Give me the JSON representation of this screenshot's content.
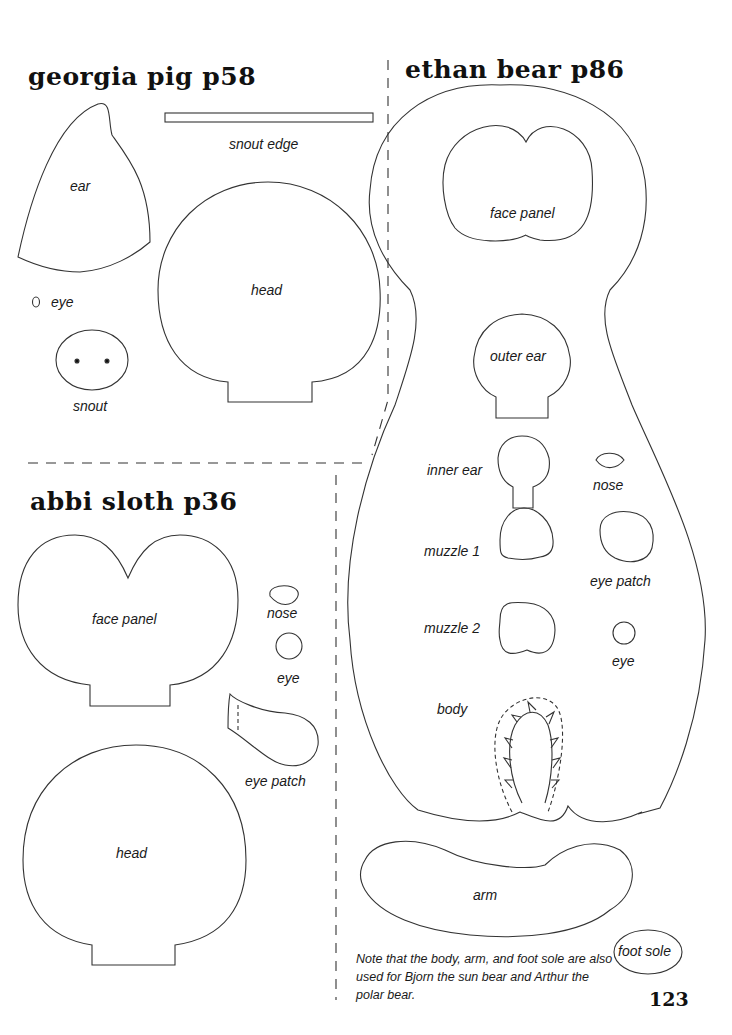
{
  "sections": {
    "georgia_pig": {
      "title": "georgia pig p58",
      "labels": {
        "ear": "ear",
        "snout_edge": "snout edge",
        "head": "head",
        "eye": "eye",
        "snout": "snout"
      }
    },
    "ethan_bear": {
      "title": "ethan bear p86",
      "labels": {
        "face_panel": "face panel",
        "outer_ear": "outer ear",
        "inner_ear": "inner ear",
        "nose": "nose",
        "muzzle_1": "muzzle 1",
        "eye_patch": "eye patch",
        "muzzle_2": "muzzle 2",
        "eye": "eye",
        "body": "body",
        "arm": "arm",
        "foot_sole": "foot sole"
      },
      "note": "Note that the body, arm, and foot sole are also used for Bjorn the sun bear and Arthur the polar bear."
    },
    "abbi_sloth": {
      "title": "abbi sloth p36",
      "labels": {
        "face_panel": "face panel",
        "nose": "nose",
        "eye": "eye",
        "eye_patch": "eye patch",
        "head": "head"
      }
    }
  },
  "page_number": "123"
}
